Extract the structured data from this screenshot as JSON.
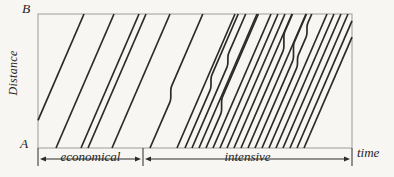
{
  "figure": {
    "axis_labels": {
      "origin": "A",
      "top": "B",
      "y_axis": "Distance",
      "x_axis": "time"
    },
    "regions": [
      {
        "label": "economical"
      },
      {
        "label": "intensive"
      }
    ],
    "colors": {
      "background": "#f8f6f2",
      "frame": "#9c9c9c",
      "line": "#2b2b2b",
      "text": "#1f1f1f"
    },
    "layout": {
      "box": {
        "left": 38,
        "top": 14,
        "right": 352,
        "bottom": 148
      },
      "divider_x": 143,
      "arrow_y": 159,
      "tick_bottom_y": 166,
      "slope_dx_per_full_height": 58,
      "line_width": 1.7,
      "corner_radius": 2.5
    },
    "train_lines": [
      {
        "t": 26,
        "risers": []
      },
      {
        "t": 56,
        "risers": []
      },
      {
        "t": 81,
        "risers": []
      },
      {
        "t": 88,
        "risers": []
      },
      {
        "t": 112,
        "risers": []
      },
      {
        "t": 150,
        "risers": [
          [
            100,
            12
          ]
        ]
      },
      {
        "t": 177,
        "risers": []
      },
      {
        "t": 185,
        "risers": [
          [
            88,
            11
          ]
        ]
      },
      {
        "t": 192,
        "risers": [
          [
            65,
            10
          ]
        ]
      },
      {
        "t": 199,
        "risers": []
      },
      {
        "t": 206,
        "risers": [
          [
            112,
            13
          ]
        ]
      },
      {
        "t": 213,
        "risers": []
      },
      {
        "t": 220,
        "risers": []
      },
      {
        "t": 227,
        "risers": []
      },
      {
        "t": 234,
        "risers": []
      },
      {
        "t": 241,
        "risers": [
          [
            49,
            15
          ]
        ]
      },
      {
        "t": 248,
        "risers": []
      },
      {
        "t": 255,
        "risers": [
          [
            59,
            15
          ]
        ]
      },
      {
        "t": 262,
        "risers": [
          [
            66,
            9
          ],
          [
            35,
            10
          ]
        ]
      },
      {
        "t": 269,
        "risers": []
      },
      {
        "t": 276,
        "risers": []
      },
      {
        "t": 283,
        "risers": []
      },
      {
        "t": 290,
        "risers": []
      },
      {
        "t": 297,
        "risers": []
      },
      {
        "t": 304,
        "risers": []
      }
    ]
  }
}
